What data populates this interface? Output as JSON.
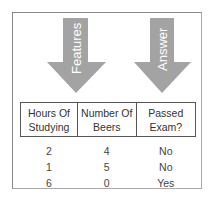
{
  "diagram": {
    "arrows": [
      {
        "label": "Features",
        "color": "#9e9e9e"
      },
      {
        "label": "Answer",
        "color": "#9e9e9e"
      }
    ]
  },
  "table": {
    "headers": [
      "Hours Of Studying",
      "Number Of Beers",
      "Passed Exam?"
    ],
    "header_lines": [
      [
        "Hours Of",
        "Studying"
      ],
      [
        "Number Of",
        "Beers"
      ],
      [
        "Passed",
        "Exam?"
      ]
    ],
    "rows": [
      [
        "2",
        "4",
        "No"
      ],
      [
        "1",
        "5",
        "No"
      ],
      [
        "6",
        "0",
        "Yes"
      ]
    ]
  }
}
